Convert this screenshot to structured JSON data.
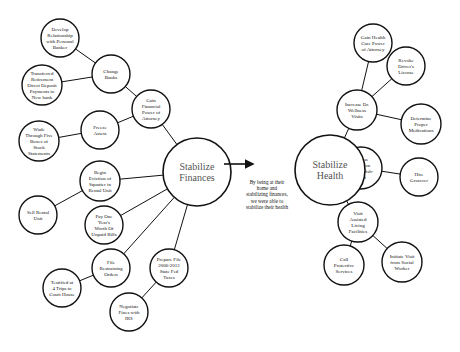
{
  "diagram": {
    "colors": {
      "stroke": "#111111",
      "background": "#ffffff",
      "hub_text": "#555555"
    },
    "hubs": [
      {
        "id": "finances",
        "label": [
          "Stabilize",
          "Finances"
        ],
        "cx": 197,
        "cy": 172,
        "r": 34
      },
      {
        "id": "health",
        "label": [
          "Stabilize",
          "Health"
        ],
        "cx": 330,
        "cy": 170,
        "r": 35
      }
    ],
    "arrow": {
      "from": [
        224,
        164
      ],
      "to": [
        253,
        164
      ]
    },
    "caption": [
      "By being at their",
      "home and",
      "stabilizing finances,",
      "we were able to",
      "stabilize their health"
    ],
    "nodes": [
      {
        "id": "develop",
        "label": [
          "Develop",
          "Relationship",
          "with Personal",
          "Banker"
        ],
        "cx": 60,
        "cy": 38,
        "r": 19
      },
      {
        "id": "change-banks",
        "label": [
          "Change",
          "Banks"
        ],
        "cx": 111,
        "cy": 74,
        "r": 19
      },
      {
        "id": "transferred",
        "label": [
          "Transferred",
          "Retirement",
          "Direct Deposit",
          "Payments to",
          "New bank"
        ],
        "cx": 42,
        "cy": 85,
        "r": 20
      },
      {
        "id": "gain-fin-poa",
        "label": [
          "Gain",
          "Financial",
          "Power of",
          "Attorney"
        ],
        "cx": 151,
        "cy": 109,
        "r": 19
      },
      {
        "id": "freeze",
        "label": [
          "Freeze",
          "Assets"
        ],
        "cx": 100,
        "cy": 130,
        "r": 19
      },
      {
        "id": "wade",
        "label": [
          "Wade",
          "Through Five",
          "Boxes of",
          "Stock",
          "Statements"
        ],
        "cx": 39,
        "cy": 141,
        "r": 20
      },
      {
        "id": "eviction",
        "label": [
          "Begin",
          "Eviction of",
          "Squatter in",
          "Rental Unit"
        ],
        "cx": 100,
        "cy": 181,
        "r": 20
      },
      {
        "id": "sell",
        "label": [
          "Sell Rental",
          "Unit"
        ],
        "cx": 38,
        "cy": 215,
        "r": 19
      },
      {
        "id": "pay",
        "label": [
          "Pay One",
          "Year's",
          "Worth Of",
          "Unpaid Bills"
        ],
        "cx": 104,
        "cy": 225,
        "r": 19
      },
      {
        "id": "restraining",
        "label": [
          "File",
          "Restraining",
          "Orders"
        ],
        "cx": 111,
        "cy": 268,
        "r": 19
      },
      {
        "id": "testified",
        "label": [
          "Testified at",
          "4 Trips to",
          "Court House"
        ],
        "cx": 62,
        "cy": 288,
        "r": 19
      },
      {
        "id": "prepare",
        "label": [
          "Prepare File",
          "2006-2012",
          "State Fed",
          "Taxes"
        ],
        "cx": 169,
        "cy": 268,
        "r": 19
      },
      {
        "id": "negotiate",
        "label": [
          "Negotiate",
          "Fines with",
          "IRS"
        ],
        "cx": 129,
        "cy": 312,
        "r": 19
      },
      {
        "id": "gain-hc-poa",
        "label": [
          "Gain Health",
          "Care Power",
          "of Attorney"
        ],
        "cx": 373,
        "cy": 43,
        "r": 19
      },
      {
        "id": "revoke",
        "label": [
          "Revoke",
          "Driver's",
          "License"
        ],
        "cx": 406,
        "cy": 66,
        "r": 19
      },
      {
        "id": "wellness",
        "label": [
          "Increase Dr.",
          "Wellness",
          "Visits"
        ],
        "cx": 357,
        "cy": 110,
        "r": 20
      },
      {
        "id": "medications",
        "label": [
          "Determine",
          "Proper",
          "Medications"
        ],
        "cx": 421,
        "cy": 124,
        "r": 20
      },
      {
        "id": "nutrition",
        "label": [
          "Assess",
          "Nutrition",
          "Malnourish-",
          "ment"
        ],
        "cx": 361,
        "cy": 168,
        "r": 21
      },
      {
        "id": "grocer",
        "label": [
          "Hire",
          "Grocerer"
        ],
        "cx": 419,
        "cy": 177,
        "r": 19
      },
      {
        "id": "assisted",
        "label": [
          "Visit",
          "Assisted",
          "Living",
          "Facilities"
        ],
        "cx": 358,
        "cy": 222,
        "r": 20
      },
      {
        "id": "protective",
        "label": [
          "Call",
          "Protective",
          "Services"
        ],
        "cx": 344,
        "cy": 265,
        "r": 20
      },
      {
        "id": "social",
        "label": [
          "Initiate Visit",
          "from Social",
          "Worker"
        ],
        "cx": 402,
        "cy": 262,
        "r": 20
      }
    ],
    "edges": [
      [
        "develop",
        "change-banks"
      ],
      [
        "transferred",
        "change-banks"
      ],
      [
        "change-banks",
        "gain-fin-poa"
      ],
      [
        "freeze",
        "gain-fin-poa"
      ],
      [
        "gain-fin-poa",
        "finances"
      ],
      [
        "wade",
        "freeze"
      ],
      [
        "sell",
        "eviction"
      ],
      [
        "eviction",
        "finances"
      ],
      [
        "pay",
        "finances"
      ],
      [
        "restraining",
        "finances"
      ],
      [
        "testified",
        "restraining"
      ],
      [
        "prepare",
        "finances"
      ],
      [
        "negotiate",
        "prepare"
      ],
      [
        "gain-hc-poa",
        "wellness"
      ],
      [
        "revoke",
        "wellness"
      ],
      [
        "wellness",
        "medications"
      ],
      [
        "wellness",
        "health"
      ],
      [
        "nutrition",
        "health"
      ],
      [
        "nutrition",
        "grocer"
      ],
      [
        "assisted",
        "health"
      ],
      [
        "assisted",
        "protective"
      ],
      [
        "assisted",
        "social"
      ]
    ]
  }
}
